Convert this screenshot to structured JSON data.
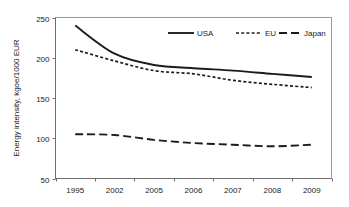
{
  "chart_data": {
    "type": "line",
    "title": "",
    "xlabel": "",
    "ylabel": "Energy intensity, kgoe/1000 EUR",
    "categories": [
      "1995",
      "2002",
      "2005",
      "2006",
      "2007",
      "2008",
      "2009"
    ],
    "ylim": [
      50,
      250
    ],
    "yticks": [
      50,
      100,
      150,
      200,
      250
    ],
    "ytick_labels": [
      "50",
      "100",
      "150",
      "200",
      "250"
    ],
    "grid": false,
    "legend_position": "top-right-inside",
    "series": [
      {
        "name": "USA",
        "style": "solid",
        "color": "#1c1c1c",
        "values": [
          240,
          205,
          191,
          187,
          184,
          180,
          176
        ]
      },
      {
        "name": "EU",
        "style": "dotted",
        "color": "#1c1c1c",
        "values": [
          210,
          196,
          184,
          180,
          172,
          167,
          163
        ]
      },
      {
        "name": "Japan",
        "style": "dashed",
        "color": "#1c1c1c",
        "values": [
          105,
          104,
          98,
          94,
          92,
          90,
          92
        ]
      }
    ]
  },
  "legend": {
    "items": [
      {
        "label": "USA",
        "style": "solid"
      },
      {
        "label": "EU",
        "style": "dotted"
      },
      {
        "label": "Japan",
        "style": "dashed"
      }
    ]
  }
}
